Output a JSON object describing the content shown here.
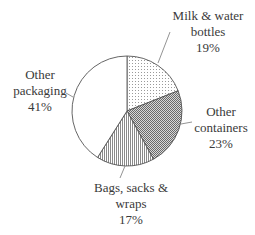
{
  "chart_data": {
    "type": "pie",
    "title": "",
    "start_angle_deg": 0,
    "direction": "clockwise",
    "slices": [
      {
        "label": "Milk & water bottles",
        "lines": [
          "Milk & water",
          "bottles"
        ],
        "value": 19,
        "pct_label": "19%",
        "pattern": "dots"
      },
      {
        "label": "Other containers",
        "lines": [
          "Other",
          "containers"
        ],
        "value": 23,
        "pct_label": "23%",
        "pattern": "checker"
      },
      {
        "label": "Bags, sacks & wraps",
        "lines": [
          "Bags, sacks &",
          "wraps"
        ],
        "value": 17,
        "pct_label": "17%",
        "pattern": "vlines"
      },
      {
        "label": "Other packaging",
        "lines": [
          "Other",
          "packaging"
        ],
        "value": 41,
        "pct_label": "41%",
        "pattern": "none"
      }
    ],
    "legend": "none (direct labels with leader lines)"
  },
  "colors": {
    "outline": "#555555",
    "pattern_ink": "#666666",
    "background": "#ffffff",
    "text": "#3a3a3a"
  }
}
